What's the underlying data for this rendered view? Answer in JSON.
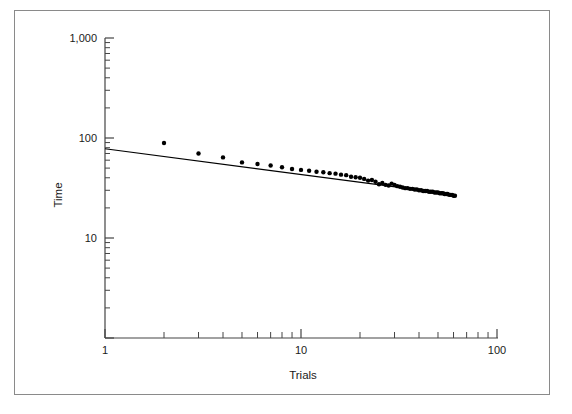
{
  "chart_data": {
    "type": "scatter",
    "title": "",
    "xlabel": "Trials",
    "ylabel": "Time",
    "xscale": "log",
    "yscale": "log",
    "xlim": [
      1,
      100
    ],
    "ylim": [
      1,
      1000
    ],
    "grid": false,
    "legend": null,
    "xticks": [
      1,
      10,
      100
    ],
    "xticklabels": [
      "1",
      "10",
      "100"
    ],
    "yticks": [
      10,
      100,
      1000
    ],
    "yticklabels": [
      "10",
      "100",
      "1,000"
    ],
    "marker": "filled-circle",
    "marker_color": "#000000",
    "x": [
      2,
      3,
      4,
      5,
      6,
      7,
      8,
      9,
      10,
      11,
      12,
      13,
      14,
      15,
      16,
      17,
      18,
      19,
      20,
      21,
      22,
      23,
      24,
      25,
      26,
      27,
      28,
      29,
      30,
      31,
      32,
      33,
      34,
      35,
      36,
      37,
      38,
      39,
      40,
      41,
      42,
      43,
      44,
      45,
      46,
      47,
      48,
      49,
      50,
      51,
      52,
      53,
      54,
      55,
      56,
      57,
      58,
      59,
      60,
      61
    ],
    "y": [
      89,
      70,
      64,
      57,
      55,
      53,
      51,
      49,
      48,
      47,
      46,
      45.5,
      44.5,
      44,
      43,
      42.5,
      41,
      40.5,
      40,
      39,
      37.5,
      38,
      36.5,
      34.5,
      35.5,
      34,
      33.5,
      35,
      34,
      33,
      32.5,
      32,
      31.5,
      31.5,
      31,
      31,
      30.5,
      30.5,
      30,
      30,
      29.5,
      29.5,
      29.5,
      29,
      29,
      29,
      28.5,
      28.5,
      28.5,
      28,
      28,
      28,
      27.5,
      27.5,
      27.5,
      27,
      27,
      27,
      26.5,
      26.5
    ],
    "fit_line": {
      "type": "power-law",
      "x_start": 1,
      "y_start": 78,
      "x_end": 62,
      "y_end": 27,
      "color": "#000000"
    }
  },
  "figure": {
    "border_color": "#8a8a8a",
    "background": "#ffffff"
  }
}
